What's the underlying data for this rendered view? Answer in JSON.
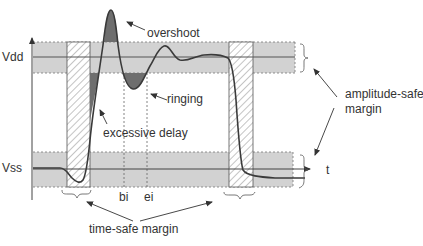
{
  "diagram": {
    "labels": {
      "vdd": "Vdd",
      "vss": "Vss",
      "t": "t",
      "bi": "bi",
      "ei": "ei",
      "overshoot": "overshoot",
      "ringing": "ringing",
      "excessive_delay": "excessive delay",
      "amplitude_safe_margin_line1": "amplitude-safe",
      "amplitude_safe_margin_line2": "margin",
      "time_safe_margin": "time-safe margin"
    },
    "colors": {
      "band": "#cfcfcf",
      "signal": "#444444",
      "shaded_error": "#6e6e6e",
      "hatch": "#888888",
      "text": "#333333"
    }
  }
}
